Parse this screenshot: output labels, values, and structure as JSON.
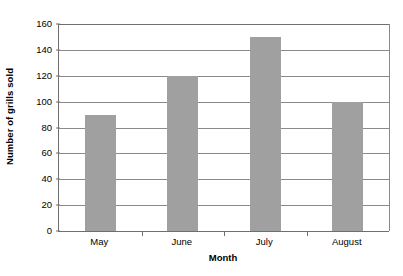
{
  "chart_data": {
    "type": "bar",
    "title": "",
    "categories": [
      "May",
      "June",
      "July",
      "August"
    ],
    "values": [
      90,
      120,
      150,
      100
    ],
    "series": [
      {
        "name": "Number of grills sold",
        "values": [
          90,
          120,
          150,
          100
        ]
      }
    ],
    "xlabel": "Month",
    "ylabel": "Number of grills sold",
    "ylim": [
      0,
      160
    ],
    "ytick_step": 20,
    "yticks": [
      0,
      20,
      40,
      60,
      80,
      100,
      120,
      140,
      160
    ],
    "ytick_labels": [
      "0",
      "20",
      "40",
      "60",
      "80",
      "100",
      "120",
      "140",
      "160"
    ],
    "grid": true,
    "grid_axis": "y",
    "legend": false,
    "bar_color": "#a0a0a0",
    "axis_color": "#6f6f6f",
    "grid_color": "#8a8a8a",
    "background": "#ffffff"
  }
}
